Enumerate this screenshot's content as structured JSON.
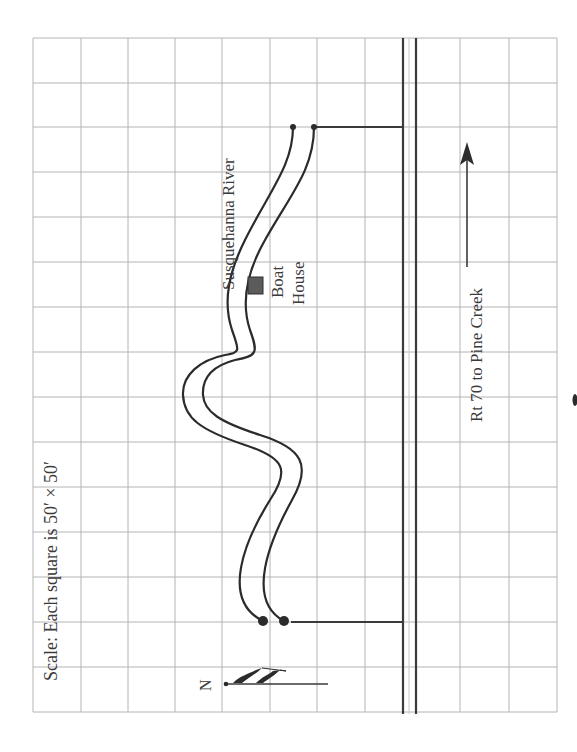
{
  "map": {
    "title": "Boat House location map",
    "scale_label": "Scale: Each square is 50′ × 50′",
    "river_label": "Susquehanna River",
    "boat_house_label_line1": "Boat",
    "boat_house_label_line2": "House",
    "road_label": "Rt 70 to Pine Creek",
    "compass_label": "N",
    "colors": {
      "grid": "#b4b4b4",
      "lines": "#2b2b2b",
      "boat_house": "#5b5b5b",
      "background": "#ffffff"
    },
    "grid": {
      "columns_x": [
        33,
        81,
        128,
        175,
        222,
        270,
        317,
        365,
        413,
        460,
        509,
        557
      ],
      "rows_y": [
        38,
        83,
        127,
        172,
        217,
        262,
        307,
        352,
        397,
        442,
        487,
        532,
        577,
        622,
        667,
        712
      ],
      "square_size_feet": 50
    },
    "road": {
      "name": "Rt 70",
      "destination": "Pine Creek",
      "direction": "up (arrow)"
    }
  }
}
